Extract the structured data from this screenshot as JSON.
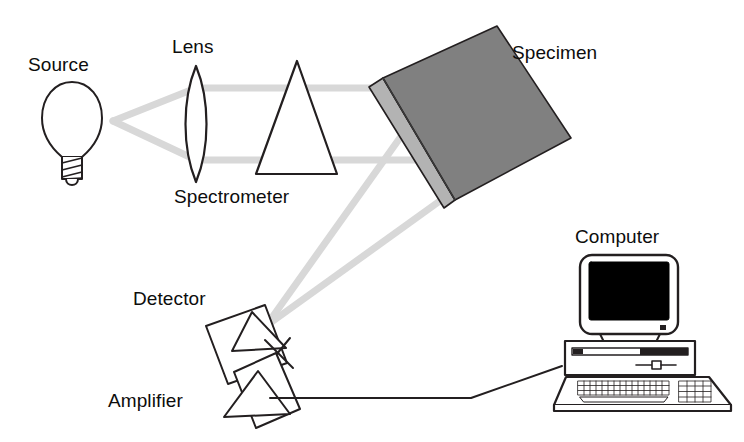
{
  "diagram": {
    "background_color": "#ffffff",
    "line_color": "#231f20",
    "beam_color": "#d8d8d8",
    "specimen_top_color": "#808080",
    "specimen_edge_color": "#b3b3b3",
    "screen_color": "#000000",
    "labels": {
      "source": "Source",
      "lens": "Lens",
      "spectrometer": "Spectrometer",
      "specimen": "Specimen",
      "detector": "Detector",
      "amplifier": "Amplifier",
      "computer": "Computer"
    },
    "components": [
      {
        "name": "source",
        "label": "Source",
        "shape": "light-bulb"
      },
      {
        "name": "lens",
        "label": "Lens",
        "shape": "biconvex-lens"
      },
      {
        "name": "spectrometer",
        "label": "Spectrometer",
        "shape": "prism-triangle"
      },
      {
        "name": "specimen",
        "label": "Specimen",
        "shape": "tilted-slab"
      },
      {
        "name": "detector",
        "label": "Detector",
        "shape": "rotated-square-triangle-cluster"
      },
      {
        "name": "amplifier",
        "label": "Amplifier",
        "shape": "rotated-square-triangle-cluster"
      },
      {
        "name": "computer",
        "label": "Computer",
        "shape": "crt-desktop-computer"
      }
    ],
    "beams": [
      {
        "name": "source-to-lens",
        "from": "source",
        "to": "lens",
        "style": "diverging-cone"
      },
      {
        "name": "lens-to-specimen",
        "from": "lens",
        "to": "specimen",
        "style": "collimated-parallel"
      },
      {
        "name": "specimen-to-detector",
        "from": "specimen",
        "to": "detector",
        "style": "converging-cone"
      }
    ],
    "connections": [
      {
        "name": "amplifier-to-computer-cable",
        "from": "amplifier",
        "to": "computer",
        "style": "solid-line"
      }
    ]
  }
}
